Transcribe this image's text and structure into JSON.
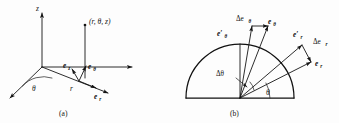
{
  "figure": {
    "panels": [
      {
        "id": "a",
        "caption": "(a)",
        "description": "cylindrical coordinate axes with unit vectors",
        "axis_labels": {
          "z": "z",
          "radial": "r",
          "angle": "θ"
        },
        "point_label": "(r, θ, z)",
        "unit_vectors": [
          {
            "name": "e-z",
            "base": "e",
            "subscript": "z"
          },
          {
            "name": "e-theta",
            "base": "e",
            "subscript": "θ"
          },
          {
            "name": "e-r",
            "base": "e",
            "subscript": "r"
          }
        ]
      },
      {
        "id": "b",
        "caption": "(b)",
        "description": "semicircle showing rotation of unit vectors through delta theta",
        "angle_labels": {
          "theta": "θ",
          "delta_theta": "Δθ"
        },
        "unit_vectors": [
          {
            "name": "delta-e-theta",
            "base": "Δe",
            "subscript": "θ"
          },
          {
            "name": "e-theta",
            "base": "e",
            "subscript": "θ"
          },
          {
            "name": "e-theta-prime",
            "base": "e′",
            "subscript": "θ"
          },
          {
            "name": "e-r-prime",
            "base": "e′",
            "subscript": "r"
          },
          {
            "name": "delta-e-r",
            "base": "Δe",
            "subscript": "r"
          },
          {
            "name": "e-r",
            "base": "e",
            "subscript": "r"
          }
        ]
      }
    ]
  },
  "labels": {
    "panel_a": {
      "z_axis": "z",
      "point": "(r, θ, z)",
      "theta": "θ",
      "r": "r",
      "e_base": "e",
      "sub_z": "z",
      "sub_theta": "θ",
      "sub_r": "r",
      "caption": "(a)"
    },
    "panel_b": {
      "delta_e": "Δe",
      "e_base": "e",
      "e_prime": "e′",
      "sub_theta": "θ",
      "sub_r": "r",
      "delta_theta": "Δθ",
      "theta": "θ",
      "caption": "(b)"
    }
  },
  "colors": {
    "ink": "#141414",
    "paper": "#fdfdfd"
  }
}
